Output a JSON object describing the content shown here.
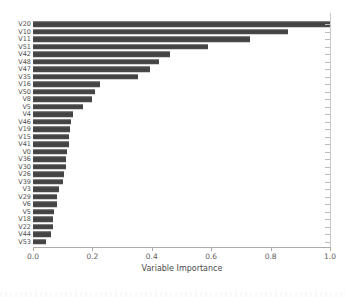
{
  "chart_data": {
    "type": "bar",
    "orientation": "horizontal",
    "title": "",
    "xlabel": "Variable Importance",
    "ylabel": "",
    "xlim": [
      0,
      1.0
    ],
    "x_tick_labels": [
      "0.0",
      "0.2",
      "0.4",
      "0.6",
      "0.8",
      "1.0"
    ],
    "x_tick_values": [
      0,
      0.2,
      0.4,
      0.6,
      0.8,
      1.0
    ],
    "grid": false,
    "legend": "none",
    "bar_color": "#474747",
    "axis_color": "#ababab",
    "label_color": "#4d4d4d",
    "categories": [
      "V20",
      "V10",
      "V11",
      "V51",
      "V42",
      "V48",
      "V47",
      "V35",
      "V16",
      "V50",
      "V8",
      "V5",
      "V4",
      "V46",
      "V19",
      "V15",
      "V41",
      "V0",
      "V36",
      "V30",
      "V26",
      "V39",
      "V3",
      "V29",
      "V6",
      "V5",
      "V18",
      "V22",
      "V44",
      "V53"
    ],
    "values": [
      1.0,
      0.86,
      0.73,
      0.59,
      0.46,
      0.425,
      0.395,
      0.355,
      0.225,
      0.21,
      0.2,
      0.17,
      0.135,
      0.128,
      0.125,
      0.122,
      0.121,
      0.114,
      0.112,
      0.11,
      0.103,
      0.1,
      0.088,
      0.082,
      0.08,
      0.071,
      0.068,
      0.066,
      0.06,
      0.044
    ]
  }
}
